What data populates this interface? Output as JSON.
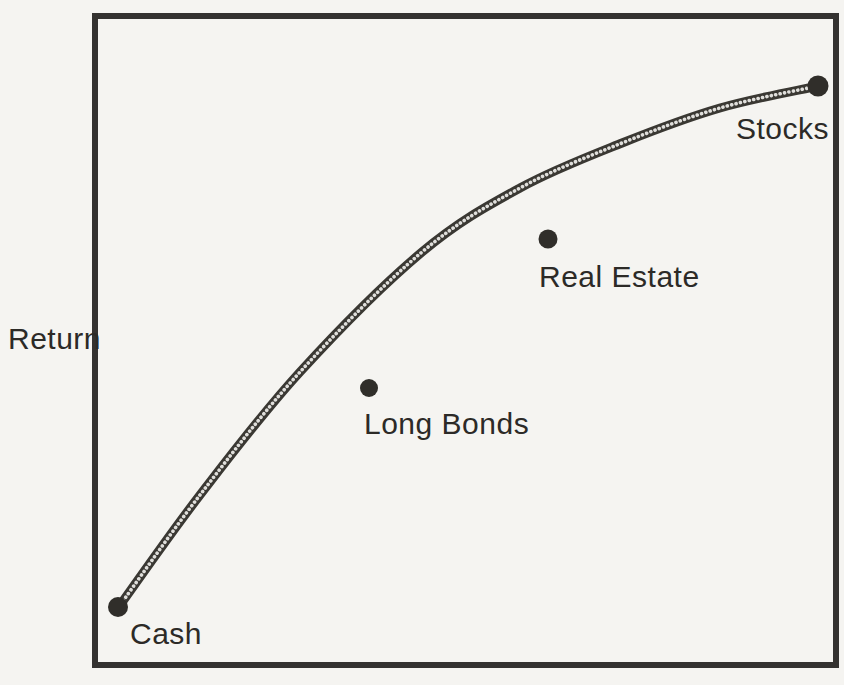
{
  "figure": {
    "paper_color": "#f5f4f1",
    "ink_color": "#33312d"
  },
  "chart_data": {
    "type": "scatter",
    "title": "",
    "xlabel": "",
    "ylabel": "Return",
    "axes": {
      "frame": "full-box",
      "grid": false,
      "x_ticks": [],
      "y_ticks": []
    },
    "points": [
      {
        "label": "Cash",
        "px": 118,
        "py": 607,
        "r": 10,
        "label_x": 130,
        "label_y": 644,
        "on_curve": true
      },
      {
        "label": "Long Bonds",
        "px": 369,
        "py": 388,
        "r": 9,
        "label_x": 364,
        "label_y": 434,
        "on_curve": false
      },
      {
        "label": "Real Estate",
        "px": 548,
        "py": 239,
        "r": 9.5,
        "label_x": 539,
        "label_y": 287,
        "on_curve": false
      },
      {
        "label": "Stocks",
        "px": 818,
        "py": 86,
        "r": 10.5,
        "label_x": 736,
        "label_y": 139,
        "on_curve": true
      }
    ],
    "frontier_curve_px": [
      [
        118,
        608
      ],
      [
        200,
        495
      ],
      [
        300,
        372
      ],
      [
        422,
        252
      ],
      [
        520,
        188
      ],
      [
        622,
        143
      ],
      [
        720,
        108
      ],
      [
        818,
        86
      ]
    ]
  }
}
